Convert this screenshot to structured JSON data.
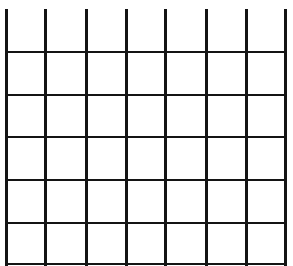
{
  "grid": {
    "line_color": "#141414",
    "columns": 7,
    "rows": 6,
    "vertical_lines_x": [
      6,
      45,
      86,
      126,
      165,
      206,
      246,
      285
    ],
    "vertical_top": 9,
    "vertical_bottom": 266,
    "horizontal_lines_y": [
      52,
      95,
      137,
      180,
      223,
      264
    ],
    "horizontal_left": 6,
    "horizontal_right": 287,
    "vertical_thickness": 3,
    "horizontal_thickness": 2
  }
}
